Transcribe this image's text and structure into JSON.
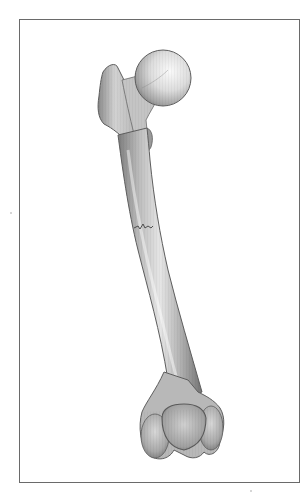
{
  "figure": {
    "caption": "",
    "style": "grayscale pencil-shaded medical illustration",
    "colors": {
      "background": "#ffffff",
      "frame_border": "#6a6a6a",
      "bone_light": "#f2f2f2",
      "bone_mid": "#bdbdbd",
      "bone_dark": "#7a7a7a",
      "outline": "#5e5e5e",
      "fracture_line": "#4a4a4a"
    },
    "parts": [
      {
        "name": "femoral-head",
        "label": ""
      },
      {
        "name": "femoral-neck",
        "label": ""
      },
      {
        "name": "greater-trochanter",
        "label": ""
      },
      {
        "name": "lesser-trochanter",
        "label": ""
      },
      {
        "name": "shaft",
        "label": ""
      },
      {
        "name": "fracture",
        "label": ""
      },
      {
        "name": "medial-condyle",
        "label": ""
      },
      {
        "name": "lateral-condyle",
        "label": ""
      },
      {
        "name": "patellar-surface",
        "label": ""
      }
    ]
  }
}
